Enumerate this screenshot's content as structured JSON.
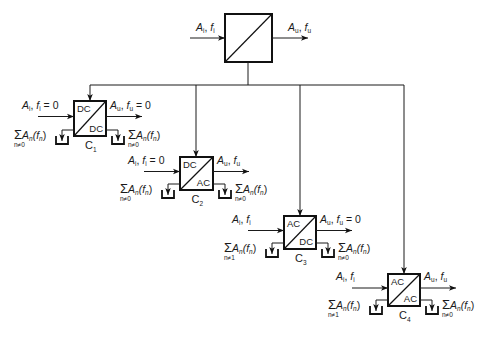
{
  "diagram": {
    "type": "converter-classification",
    "main_converter": {
      "input_label": "A_i, f_i",
      "output_label": "A_u, f_u",
      "box": {
        "x": 225,
        "y": 14,
        "w": 47,
        "h": 48
      }
    },
    "bus": {
      "y": 85,
      "x_from": 90,
      "x_to": 404,
      "stem_x": 248
    },
    "converters": [
      {
        "id": "C1",
        "name": "C",
        "index": "1",
        "top": "DC",
        "bottom": "AC_DC_placeholder",
        "top_label": "DC",
        "bottom_label": "DC",
        "input": {
          "A": "A",
          "A_sub": "i",
          "f": "f",
          "f_sub": "i",
          "suffix": " = 0"
        },
        "output": {
          "A": "A",
          "A_sub": "u",
          "f": "f",
          "f_sub": "u",
          "suffix": " = 0"
        },
        "left_sum": {
          "symbol": "Σ",
          "body": "A",
          "sub": "n",
          "paren": "(f",
          "paren_sub": "n",
          "close": ")",
          "under": "n≠0"
        },
        "right_sum": {
          "symbol": "Σ",
          "body": "A",
          "sub": "n",
          "paren": "(f",
          "paren_sub": "n",
          "close": ")",
          "under": "n≠0"
        },
        "box": {
          "x": 74,
          "y": 101,
          "w": 32,
          "h": 35
        }
      },
      {
        "id": "C2",
        "name": "C",
        "index": "2",
        "top_label": "DC",
        "bottom_label": "AC",
        "input": {
          "A": "A",
          "A_sub": "i",
          "f": "f",
          "f_sub": "i",
          "suffix": " = 0"
        },
        "output": {
          "A": "A",
          "A_sub": "u",
          "f": "f",
          "f_sub": "u",
          "suffix": ""
        },
        "left_sum": {
          "symbol": "Σ",
          "body": "A",
          "sub": "n",
          "paren": "(f",
          "paren_sub": "n",
          "close": ")",
          "under": "n≠0"
        },
        "right_sum": {
          "symbol": "Σ",
          "body": "A",
          "sub": "n",
          "paren": "(f",
          "paren_sub": "n",
          "close": ")",
          "under": "n≠0"
        },
        "box": {
          "x": 180,
          "y": 157,
          "w": 33,
          "h": 33
        }
      },
      {
        "id": "C3",
        "name": "C",
        "index": "3",
        "top_label": "AC",
        "bottom_label": "DC",
        "input": {
          "A": "A",
          "A_sub": "i",
          "f": "f",
          "f_sub": "i",
          "suffix": ""
        },
        "output": {
          "A": "A",
          "A_sub": "u",
          "f": "f",
          "f_sub": "u",
          "suffix": " = 0"
        },
        "left_sum": {
          "symbol": "Σ",
          "body": "A",
          "sub": "n",
          "paren": "(f",
          "paren_sub": "n",
          "close": ")",
          "under": "n≠1"
        },
        "right_sum": {
          "symbol": "Σ",
          "body": "A",
          "sub": "n",
          "paren": "(f",
          "paren_sub": "n",
          "close": ")",
          "under": "n≠0"
        },
        "box": {
          "x": 284,
          "y": 216,
          "w": 32,
          "h": 33
        }
      },
      {
        "id": "C4",
        "name": "C",
        "index": "4",
        "top_label": "AC",
        "bottom_label": "AC",
        "input": {
          "A": "A",
          "A_sub": "i",
          "f": "f",
          "f_sub": "i",
          "suffix": ""
        },
        "output": {
          "A": "A",
          "A_sub": "u",
          "f": "f",
          "f_sub": "u",
          "suffix": ""
        },
        "left_sum": {
          "symbol": "Σ",
          "body": "A",
          "sub": "n",
          "paren": "(f",
          "paren_sub": "n",
          "close": ")",
          "under": "n≠1"
        },
        "right_sum": {
          "symbol": "Σ",
          "body": "A",
          "sub": "n",
          "paren": "(f",
          "paren_sub": "n",
          "close": ")",
          "under": "n≠0"
        },
        "box": {
          "x": 388,
          "y": 274,
          "w": 32,
          "h": 32
        }
      }
    ]
  }
}
